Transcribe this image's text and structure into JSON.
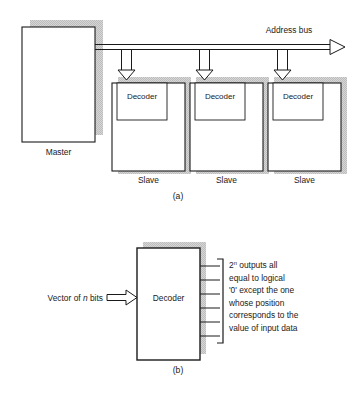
{
  "figure": {
    "parts": [
      {
        "id": "a",
        "caption": "(a)",
        "bus_label": "Address bus",
        "master_label": "Master",
        "nodes": [
          {
            "slave_label": "Slave",
            "decoder_label": "Decoder"
          },
          {
            "slave_label": "Slave",
            "decoder_label": "Decoder"
          },
          {
            "slave_label": "Slave",
            "decoder_label": "Decoder"
          }
        ]
      },
      {
        "id": "b",
        "caption": "(b)",
        "input_label_pre": "Vector of ",
        "input_label_var": "n",
        "input_label_post": " bits",
        "decoder_label": "Decoder",
        "output_count": 6,
        "annotation_lines": [
          "outputs all",
          "equal to logical",
          "'0' except the one",
          "whose position",
          "corresponds to the",
          "value of input data"
        ],
        "annotation_base": "2",
        "annotation_exp": "n"
      }
    ],
    "colors": {
      "stroke": "#1a1a1a",
      "shadow": "#c9c9c9",
      "fill": "#ffffff",
      "background": "#ffffff"
    }
  }
}
